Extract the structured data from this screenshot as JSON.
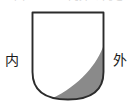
{
  "figure": {
    "caption_clipped": "図 ２．２  内外の向き",
    "labels": {
      "inner": "内",
      "outer": "外"
    },
    "colors": {
      "outline": "#2b2b2b",
      "shaded_region": "#8a8a8a",
      "unshaded_region": "#ffffff",
      "background": "#ffffff",
      "label_text": "#1b1b1b"
    },
    "shape": {
      "name": "shield-outline",
      "description": "flat-topped U-shaped shield with rounded lower corners",
      "top_y": 12,
      "bottom_y": 100,
      "left_x": 32,
      "right_x": 104
    },
    "shaded_crescent": {
      "name": "gray-crescent",
      "enters_right_edge_y": 43,
      "meets_bottom_x": 53
    }
  }
}
